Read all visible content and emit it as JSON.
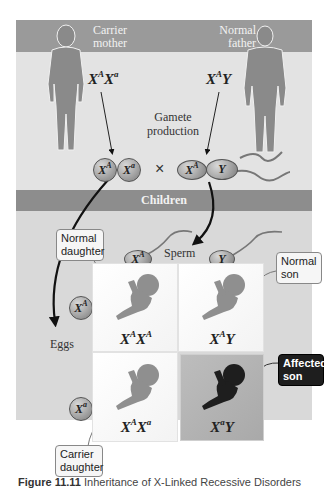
{
  "diagram": {
    "header": {
      "mother_label_line1": "Carrier",
      "mother_label_line2": "mother",
      "father_label_line1": "Normal",
      "father_label_line2": "father"
    },
    "parents": {
      "mother_genotype": {
        "base1": "X",
        "sup1": "A",
        "base2": "X",
        "sup2": "a"
      },
      "father_genotype": {
        "base1": "X",
        "sup1": "A",
        "base2": "Y",
        "sup2": ""
      }
    },
    "gamete_production_line1": "Gamete",
    "gamete_production_line2": "production",
    "cross_symbol": "×",
    "mother_gametes": [
      {
        "base": "X",
        "sup": "A"
      },
      {
        "base": "X",
        "sup": "a"
      }
    ],
    "father_gametes": [
      {
        "base": "X",
        "sup": "A"
      },
      {
        "base": "Y",
        "sup": ""
      }
    ],
    "children_band_label": "Children",
    "sperm_label": "Sperm",
    "eggs_label": "Eggs",
    "punnett": {
      "columns": [
        {
          "base": "X",
          "sup": "A"
        },
        {
          "base": "Y",
          "sup": ""
        }
      ],
      "rows": [
        {
          "base": "X",
          "sup": "A"
        },
        {
          "base": "X",
          "sup": "a"
        }
      ],
      "cells": [
        {
          "g1": "X",
          "s1": "A",
          "g2": "X",
          "s2": "A",
          "status": "normal"
        },
        {
          "g1": "X",
          "s1": "A",
          "g2": "Y",
          "s2": "",
          "status": "normal"
        },
        {
          "g1": "X",
          "s1": "A",
          "g2": "X",
          "s2": "a",
          "status": "carrier"
        },
        {
          "g1": "X",
          "s1": "a",
          "g2": "Y",
          "s2": "",
          "status": "affected"
        }
      ]
    },
    "callouts": {
      "normal_daughter_line1": "Normal",
      "normal_daughter_line2": "daughter",
      "normal_son_line1": "Normal",
      "normal_son_line2": "son",
      "affected_son_line1": "Affected",
      "affected_son_line2": "son",
      "carrier_daughter_line1": "Carrier",
      "carrier_daughter_line2": "daughter"
    },
    "colors": {
      "band": "#9a9a9a",
      "panel": "#e3e3e3",
      "affected_cell": "#b0b0b0",
      "affected_figure": "#1e1e1e",
      "normal_figure": "#8f8f8f"
    }
  },
  "caption": {
    "figure_label": "Figure 11.11",
    "text": "Inheritance of X-Linked Recessive Disorders"
  }
}
